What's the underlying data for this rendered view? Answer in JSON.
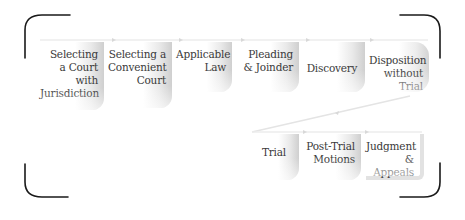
{
  "diagram": {
    "title": "",
    "row1": [
      {
        "id": "jurisdiction",
        "lines": [
          "Selecting",
          "a Court",
          "with",
          "Jurisdiction"
        ]
      },
      {
        "id": "convenient",
        "lines": [
          "Selecting a",
          "Convenient",
          "Court"
        ]
      },
      {
        "id": "law",
        "lines": [
          "Applicable",
          "Law"
        ]
      },
      {
        "id": "pleading",
        "lines": [
          "Pleading",
          "& Joinder"
        ]
      },
      {
        "id": "discovery",
        "lines": [
          "Discovery"
        ]
      },
      {
        "id": "disposition",
        "lines": [
          "Disposition",
          "without Trial"
        ]
      }
    ],
    "row2": [
      {
        "id": "trial",
        "lines": [
          "Trial"
        ]
      },
      {
        "id": "posttrial",
        "lines": [
          "Post-Trial",
          "Motions"
        ]
      },
      {
        "id": "judgment",
        "lines": [
          "Judgment",
          "& Appeals"
        ]
      }
    ],
    "colors": {
      "bracket": "#1a1a1a",
      "text": "#3a3a3a",
      "box_shade": "#cfcfcf",
      "connector": "#e0e0e0"
    }
  }
}
